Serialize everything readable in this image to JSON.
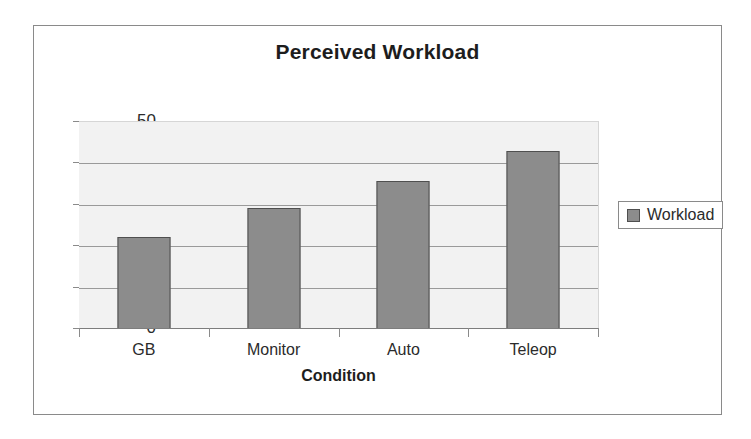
{
  "chart_data": {
    "type": "bar",
    "title": "Perceived Workload",
    "xlabel": "Condition",
    "ylabel": "",
    "categories": [
      "GB",
      "Monitor",
      "Auto",
      "Teleop"
    ],
    "series": [
      {
        "name": "Workload",
        "values": [
          22.3,
          29.3,
          35.7,
          43.0
        ]
      }
    ],
    "ylim": [
      0,
      50
    ],
    "yticks": [
      0,
      10,
      20,
      30,
      40,
      50
    ],
    "ytick_labels": [
      "0",
      "10",
      "20",
      "30",
      "40",
      "50"
    ],
    "grid": true,
    "legend_position": "right",
    "colors": {
      "bar_fill": "#8c8c8c",
      "bar_border": "#4f4f4f",
      "plot_background": "#f2f2f2",
      "gridline": "#9a9a9a",
      "frame_border": "#8a8a8a",
      "text": "#2b2b2b"
    }
  },
  "legend": {
    "entries": [
      {
        "label": "Workload",
        "swatch_name": "workload-swatch"
      }
    ]
  }
}
